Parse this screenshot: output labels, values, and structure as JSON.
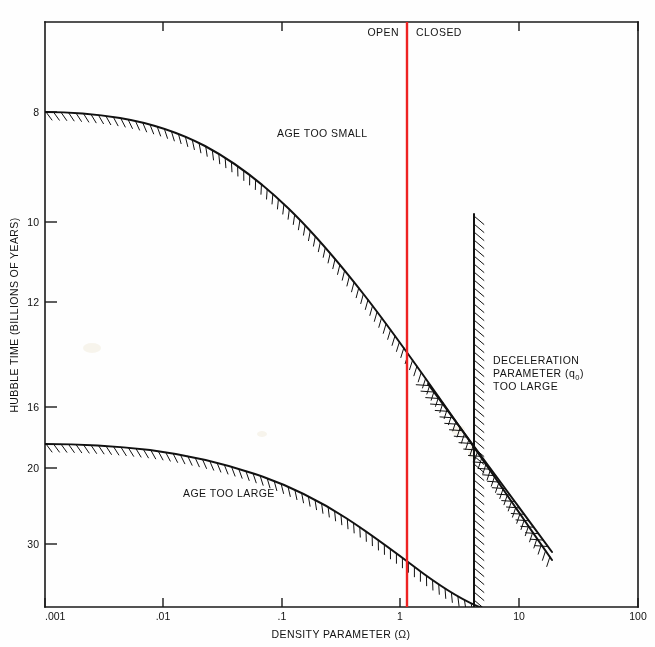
{
  "figure": {
    "background": "#fefefe",
    "frame_color": "#1a1a1a"
  },
  "chart_data": {
    "type": "line",
    "title": "",
    "xlabel": "DENSITY PARAMETER (Ω)",
    "ylabel": "HUBBLE TIME (BILLIONS OF YEARS)",
    "x_scale": "log",
    "y_scale": "reciprocal",
    "xlim": [
      0.001,
      100
    ],
    "ylim_top_value": 6.9,
    "ylim_bottom_value": 45,
    "x_ticks": [
      0.001,
      0.01,
      0.1,
      1,
      10,
      100
    ],
    "x_tick_labels": [
      ".001",
      ".01",
      ".1",
      "1",
      "10",
      "100"
    ],
    "y_ticks": [
      8,
      10,
      12,
      16,
      20,
      30
    ],
    "y_tick_labels": [
      "8",
      "10",
      "12",
      "16",
      "20",
      "30"
    ],
    "grid": false,
    "legend": "none",
    "series": [
      {
        "name": "Age too small boundary (lower age limit curve)",
        "hatch_side": "above",
        "points": [
          {
            "x": 0.001,
            "y": 8.0
          },
          {
            "x": 0.0025,
            "y": 8.05
          },
          {
            "x": 0.006,
            "y": 8.2
          },
          {
            "x": 0.013,
            "y": 8.5
          },
          {
            "x": 0.03,
            "y": 8.95
          },
          {
            "x": 0.06,
            "y": 9.5
          },
          {
            "x": 0.12,
            "y": 10.3
          },
          {
            "x": 0.25,
            "y": 11.3
          },
          {
            "x": 0.5,
            "y": 12.5
          },
          {
            "x": 1.0,
            "y": 13.9
          },
          {
            "x": 2.0,
            "y": 15.6
          },
          {
            "x": 4.0,
            "y": 17.6
          },
          {
            "x": 6.0,
            "y": 19.2
          },
          {
            "x": 9.0,
            "y": 21.5
          },
          {
            "x": 13.0,
            "y": 24.5
          }
        ]
      },
      {
        "name": "Age too large boundary (upper age limit curve)",
        "hatch_side": "above",
        "points": [
          {
            "x": 0.001,
            "y": 18.5
          },
          {
            "x": 0.003,
            "y": 18.6
          },
          {
            "x": 0.01,
            "y": 18.9
          },
          {
            "x": 0.03,
            "y": 19.6
          },
          {
            "x": 0.07,
            "y": 20.6
          },
          {
            "x": 0.15,
            "y": 22.0
          },
          {
            "x": 0.3,
            "y": 24.0
          },
          {
            "x": 0.6,
            "y": 26.6
          },
          {
            "x": 1.0,
            "y": 29.0
          },
          {
            "x": 1.8,
            "y": 32.5
          },
          {
            "x": 3.0,
            "y": 37.0
          },
          {
            "x": 4.5,
            "y": 42.0
          },
          {
            "x": 5.6,
            "y": 45.5
          }
        ]
      },
      {
        "name": "Deceleration parameter q0 vertical boundary",
        "type": "vline",
        "x": 4.0,
        "y_from": 10.15,
        "y_to": 46.0,
        "hatch_side": "right"
      },
      {
        "name": "Deceleration parameter q0 diagonal boundary",
        "type": "segment",
        "from": {
          "x": 1.55,
          "y": 14.6
        },
        "to": {
          "x": 21.0,
          "y": 30.8
        },
        "hatch_side": "lower-left"
      },
      {
        "name": "Omega equals one divider",
        "type": "vline",
        "x": 1.0,
        "color": "#ee2222"
      }
    ],
    "annotations": [
      {
        "text": "OPEN",
        "x": 0.55,
        "y_px": 33,
        "align": "end"
      },
      {
        "text": "CLOSED",
        "x": 1.9,
        "y_px": 33,
        "align": "start"
      },
      {
        "text": "AGE TOO SMALL",
        "x": 0.09,
        "y_px": 134,
        "align": "start"
      },
      {
        "text": "AGE TOO LARGE",
        "x": 0.033,
        "y_px": 495,
        "align": "start"
      },
      {
        "text": "DECELERATION",
        "x": 7.0,
        "y_px": 363,
        "align": "start"
      },
      {
        "text": "PARAMETER (q₀)",
        "x": 7.0,
        "y_px": 375,
        "align": "start"
      },
      {
        "text": "TOO LARGE",
        "x": 7.0,
        "y_px": 387,
        "align": "start"
      }
    ]
  },
  "axes": {
    "x_title": "DENSITY PARAMETER (Ω)",
    "y_title": "HUBBLE TIME (BILLIONS OF YEARS)",
    "x_tick_labels": [
      ".001",
      ".01",
      ".1",
      "1",
      "10",
      "100"
    ],
    "y_tick_labels": [
      "8",
      "10",
      "12",
      "16",
      "20",
      "30"
    ]
  },
  "labels": {
    "open": "OPEN",
    "closed": "CLOSED",
    "age_too_small": "AGE TOO SMALL",
    "age_too_large": "AGE TOO LARGE",
    "decel_line1": "DECELERATION",
    "decel_line2_prefix": "PARAMETER (q",
    "decel_line2_sub": "0",
    "decel_line2_suffix": ")",
    "decel_line3": "TOO LARGE"
  },
  "colors": {
    "divider_red": "#ee2222",
    "ink": "#111111",
    "paper": "#fefefe"
  }
}
